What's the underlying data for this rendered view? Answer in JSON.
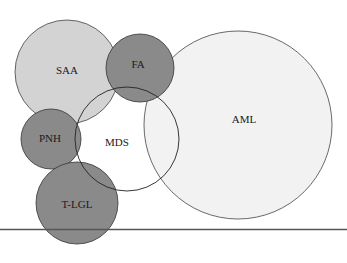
{
  "diagram": {
    "type": "euler-venn",
    "circles": [
      {
        "id": "saa",
        "label": "SAA",
        "cx": 67,
        "cy": 72,
        "r": 52,
        "fill": "#d3d3d3"
      },
      {
        "id": "aml",
        "label": "AML",
        "cx": 238,
        "cy": 125,
        "r": 94,
        "fill": "#f2f2f2"
      },
      {
        "id": "fa",
        "label": "FA",
        "cx": 140,
        "cy": 68,
        "r": 34,
        "fill": "#8a8a8a"
      },
      {
        "id": "pnh",
        "label": "PNH",
        "cx": 51,
        "cy": 139,
        "r": 30,
        "fill": "#8a8a8a"
      },
      {
        "id": "tlgl",
        "label": "T-LGL",
        "cx": 77,
        "cy": 203,
        "r": 41,
        "fill": "#8a8a8a"
      },
      {
        "id": "mds",
        "label": "MDS",
        "cx": 127,
        "cy": 139,
        "r": 52,
        "fill": "none"
      }
    ],
    "labels": {
      "saa": "SAA",
      "fa": "FA",
      "aml": "AML",
      "pnh": "PNH",
      "mds": "MDS",
      "tlgl": "T-LGL"
    },
    "stroke_color": "#333333",
    "divider_color": "#555555"
  }
}
